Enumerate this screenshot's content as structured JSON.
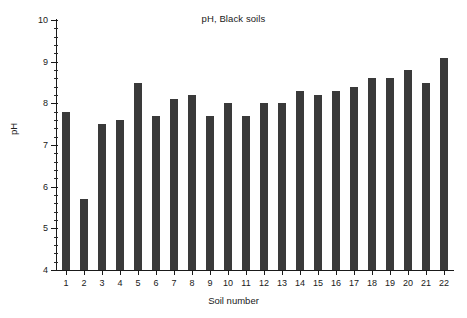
{
  "chart_data": {
    "type": "bar",
    "title": "pH, Black soils",
    "xlabel": "Soil number",
    "ylabel": "pH",
    "categories": [
      "1",
      "2",
      "3",
      "4",
      "5",
      "6",
      "7",
      "8",
      "9",
      "10",
      "11",
      "12",
      "13",
      "14",
      "15",
      "16",
      "17",
      "18",
      "19",
      "20",
      "21",
      "22"
    ],
    "values": [
      7.8,
      5.7,
      7.5,
      7.6,
      8.5,
      7.7,
      8.1,
      8.2,
      7.7,
      8.0,
      7.7,
      8.0,
      8.0,
      8.3,
      8.2,
      8.3,
      8.4,
      8.6,
      8.6,
      8.8,
      8.5,
      9.1
    ],
    "ylim": [
      4,
      10
    ],
    "ytick_labels": [
      "4",
      "5",
      "6",
      "7",
      "8",
      "9",
      "10"
    ],
    "ytick_values": [
      4,
      5,
      6,
      7,
      8,
      9,
      10
    ],
    "y_minor_step": 0.2,
    "grid": false,
    "legend": null,
    "bar_color": "#3a3a3a",
    "axis_color": "#1a1a1a",
    "background_color": "#ffffff"
  }
}
